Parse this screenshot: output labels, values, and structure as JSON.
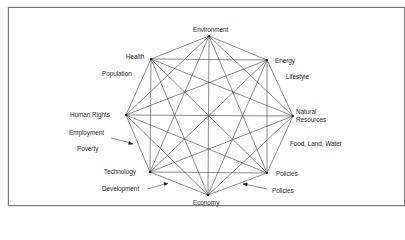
{
  "diagram": {
    "type": "complete-graph-octagon",
    "line_color": "#2b2b2b",
    "frame_color": "#7a7a7a",
    "nodes": [
      {
        "id": "environment",
        "label": "Environment",
        "x": 209,
        "y": 36
      },
      {
        "id": "energy",
        "label": "Energy",
        "x": 267,
        "y": 60
      },
      {
        "id": "natural-resources",
        "label": "Natural\nResources",
        "line1": "Natural",
        "line2": "Resources",
        "x": 293,
        "y": 116
      },
      {
        "id": "policies-node",
        "label": "Policies",
        "x": 267,
        "y": 173
      },
      {
        "id": "economy",
        "label": "Economy",
        "x": 208,
        "y": 195
      },
      {
        "id": "technology",
        "label": "Technology",
        "x": 150,
        "y": 172
      },
      {
        "id": "human-rights",
        "label": "Human Rights",
        "x": 126,
        "y": 115
      },
      {
        "id": "health",
        "label": "Health",
        "x": 151,
        "y": 59
      }
    ],
    "edge_labels": [
      {
        "id": "population",
        "label": "Population",
        "between": [
          "health",
          "human-rights"
        ]
      },
      {
        "id": "lifestyle",
        "label": "Lifestyle",
        "between": [
          "energy",
          "natural-resources"
        ]
      },
      {
        "id": "food-land-water",
        "label": "Food, Land, Water",
        "between": [
          "natural-resources",
          "policies-node"
        ]
      },
      {
        "id": "employment",
        "label": "Employment",
        "between": [
          "human-rights",
          "technology"
        ],
        "arrow": true
      },
      {
        "id": "poverty",
        "label": "Poverty",
        "between": [
          "human-rights",
          "technology"
        ]
      },
      {
        "id": "development",
        "label": "Development",
        "between": [
          "technology",
          "economy"
        ],
        "arrow": true
      },
      {
        "id": "policies-edge",
        "label": "Policies",
        "between": [
          "economy",
          "policies-node"
        ],
        "arrow": true
      }
    ]
  }
}
